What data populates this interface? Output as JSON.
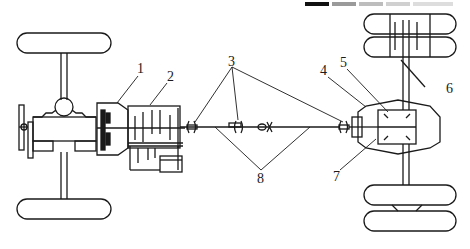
{
  "diagram": {
    "type": "vehicle-drivetrain-schematic",
    "labels": [
      {
        "id": "1",
        "text": "1",
        "x": 140,
        "y": 64
      },
      {
        "id": "2",
        "text": "2",
        "x": 169,
        "y": 72
      },
      {
        "id": "3",
        "text": "3",
        "x": 230,
        "y": 57
      },
      {
        "id": "4",
        "text": "4",
        "x": 322,
        "y": 66
      },
      {
        "id": "5",
        "text": "5",
        "x": 341,
        "y": 58
      },
      {
        "id": "6",
        "text": "6",
        "x": 448,
        "y": 83
      },
      {
        "id": "7",
        "text": "7",
        "x": 334,
        "y": 171
      },
      {
        "id": "8",
        "text": "8",
        "x": 258,
        "y": 173
      }
    ],
    "header_bars": [
      {
        "x": 305,
        "w": 24,
        "color": "#111111"
      },
      {
        "x": 332,
        "w": 24,
        "color": "#9a9a9a"
      },
      {
        "x": 359,
        "w": 24,
        "color": "#bdbdbd"
      },
      {
        "x": 386,
        "w": 24,
        "color": "#d0d0d0"
      },
      {
        "x": 413,
        "w": 40,
        "color": "#dddddd"
      }
    ],
    "stroke_color": "#1a1a1a",
    "background_color": "#ffffff"
  }
}
